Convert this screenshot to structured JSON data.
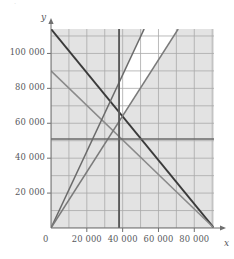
{
  "top_strip": {
    "text": "·"
  },
  "axes": {
    "y_axis_label": "y",
    "x_axis_label": "x",
    "origin_label": "0"
  },
  "chart_data": {
    "type": "line",
    "title": "",
    "subtitle": "",
    "xlabel": "x",
    "ylabel": "y",
    "xlim": [
      0,
      91000
    ],
    "ylim": [
      0,
      114000
    ],
    "grid": true,
    "grid_step_x": 10000,
    "grid_step_y": 10000,
    "legend_position": "none",
    "background_shading": "#e3e3e3",
    "feasible_region_fill": "#ffffff",
    "xticks": [
      0,
      20000,
      40000,
      60000,
      80000
    ],
    "xtick_labels": [
      "0",
      "20 000",
      "40 000",
      "60 000",
      "80 000"
    ],
    "yticks": [
      0,
      20000,
      40000,
      60000,
      80000,
      100000
    ],
    "ytick_labels": [
      "0",
      "20 000",
      "40 000",
      "60 000",
      "80 000",
      "100 000"
    ],
    "series": [
      {
        "name": "constraint-line-1",
        "color": "#3a3a3a",
        "width": 1.9,
        "points": [
          [
            0,
            114000
          ],
          [
            91000,
            0
          ]
        ]
      },
      {
        "name": "constraint-line-2",
        "color": "#8a8a8a",
        "width": 1.5,
        "points": [
          [
            0,
            90000
          ],
          [
            91000,
            0
          ]
        ]
      },
      {
        "name": "constraint-line-3",
        "color": "#6a6a6a",
        "width": 1.5,
        "points": [
          [
            0,
            0
          ],
          [
            52000,
            114000
          ]
        ]
      },
      {
        "name": "constraint-line-4",
        "color": "#7a7a7a",
        "width": 1.5,
        "points": [
          [
            0,
            0
          ],
          [
            71000,
            114000
          ]
        ]
      },
      {
        "name": "vertical-constraint",
        "color": "#5a5a5a",
        "width": 1.9,
        "points": [
          [
            38000,
            0
          ],
          [
            38000,
            114000
          ]
        ]
      },
      {
        "name": "horizontal-constraint",
        "color": "#6a6a6a",
        "width": 1.5,
        "points": [
          [
            0,
            51000
          ],
          [
            91000,
            51000
          ]
        ]
      }
    ],
    "feasible_region_vertices": [
      [
        38000,
        83000
      ],
      [
        52000,
        114000
      ],
      [
        71000,
        114000
      ],
      [
        43000,
        69000
      ],
      [
        38000,
        62000
      ]
    ],
    "intersections": [
      [
        38000,
        62000
      ],
      [
        38000,
        83000
      ],
      [
        43000,
        69000
      ],
      [
        30000,
        66000
      ],
      [
        52000,
        51000
      ]
    ]
  }
}
